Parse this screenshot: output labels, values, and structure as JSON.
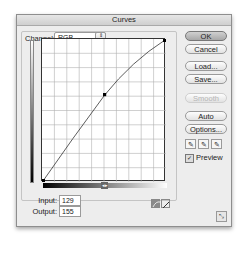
{
  "window": {
    "title": "Curves"
  },
  "channel": {
    "label": "Channel:",
    "value": "RGB",
    "stepper_icon": "⇕"
  },
  "buttons": {
    "ok": "OK",
    "cancel": "Cancel",
    "load": "Load...",
    "save": "Save...",
    "smooth": "Smooth",
    "auto": "Auto",
    "options": "Options..."
  },
  "eyedroppers": [
    {
      "name": "black-point",
      "glyph": "✎"
    },
    {
      "name": "gray-point",
      "glyph": "✎"
    },
    {
      "name": "white-point",
      "glyph": "✎"
    }
  ],
  "preview": {
    "label": "Preview",
    "checked": true,
    "check_glyph": "✓"
  },
  "input": {
    "label": "Input:",
    "value": "129"
  },
  "output": {
    "label": "Output:",
    "value": "155"
  },
  "gradient_marker": "◂▸",
  "curve": {
    "grid_divisions": 10,
    "points": [
      [
        0,
        0
      ],
      [
        129,
        155
      ],
      [
        255,
        255
      ]
    ],
    "tools": [
      {
        "name": "curve-tool",
        "active": true
      },
      {
        "name": "pencil-tool",
        "active": false
      }
    ]
  },
  "resize_icon": "⤡"
}
